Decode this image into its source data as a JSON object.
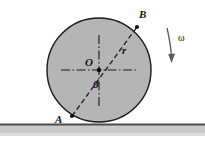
{
  "figure": {
    "kind": "physics-diagram",
    "background_color": "#ffffff",
    "disk": {
      "fill_color": "#b5b5b5",
      "stroke_color": "#1a1a1a",
      "center_x": 99,
      "center_y": 70,
      "radius": 52
    },
    "ground": {
      "line_color": "#4a4a4a",
      "band_color": "#c9c9c9",
      "y": 124
    },
    "labels": {
      "center": "O",
      "radius": "r",
      "angle": "θ",
      "point_a": "A",
      "point_b": "B",
      "angular_velocity": "ω"
    },
    "points": {
      "a": {
        "x": 72,
        "y": 116
      },
      "b": {
        "x": 137,
        "y": 27
      },
      "o": {
        "x": 99,
        "y": 70
      }
    },
    "lines": {
      "chord_style": "dashed",
      "axes_style": "dash-dot",
      "axis_h_from_x": 61,
      "axis_h_to_x": 138,
      "axis_v_from_y": 35,
      "axis_v_to_y": 106
    },
    "arrow": {
      "name": "omega-rotation-arrow",
      "direction": "clockwise-down",
      "color": "#5a5a5a"
    }
  }
}
